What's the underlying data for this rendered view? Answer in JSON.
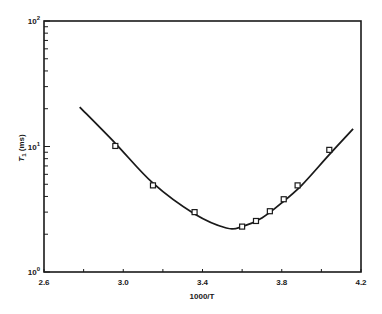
{
  "chart_data": {
    "type": "scatter",
    "title": "",
    "xlabel": "1000/T",
    "ylabel": "T₁ (ms)",
    "xlim": [
      2.6,
      4.2
    ],
    "ylim": [
      1,
      100
    ],
    "yscale": "log",
    "grid": false,
    "legend": null,
    "x_ticks": [
      2.6,
      3.0,
      3.4,
      3.8,
      4.2
    ],
    "x_tick_labels": [
      "2.6",
      "3.0",
      "3.4",
      "3.8",
      "4.2"
    ],
    "x_minor_ticks": [
      2.8,
      3.2,
      3.6,
      4.0
    ],
    "y_ticks": [
      1,
      10,
      100
    ],
    "y_tick_labels": [
      {
        "base": "10",
        "exp": "0"
      },
      {
        "base": "10",
        "exp": "1"
      },
      {
        "base": "10",
        "exp": "2"
      }
    ],
    "series": [
      {
        "name": "measured",
        "marker": "open-square",
        "x": [
          2.96,
          3.15,
          3.36,
          3.6,
          3.67,
          3.74,
          3.81,
          3.88,
          4.04
        ],
        "y": [
          10.1,
          4.9,
          3.0,
          2.3,
          2.55,
          3.05,
          3.8,
          4.9,
          9.4
        ]
      },
      {
        "name": "fit",
        "style": "solid-line",
        "x": [
          2.78,
          2.96,
          3.15,
          3.36,
          3.52,
          3.6,
          3.7,
          3.8,
          3.9,
          4.04,
          4.16
        ],
        "y": [
          20.6,
          10.6,
          5.1,
          2.9,
          2.24,
          2.3,
          2.7,
          3.55,
          4.9,
          8.6,
          13.8
        ]
      }
    ]
  },
  "labels": {
    "xlabel": "1000/T",
    "ylabel_main": "T",
    "ylabel_sub": "1",
    "ylabel_units": " (ms)"
  }
}
